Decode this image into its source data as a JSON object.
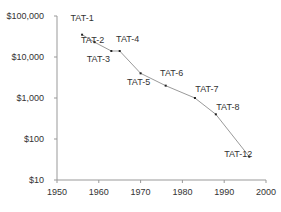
{
  "chart_data": {
    "type": "line",
    "title": "",
    "xlabel": "",
    "ylabel": "",
    "yscale": "log",
    "xlim": [
      1950,
      2000
    ],
    "ylim": [
      10,
      100000
    ],
    "grid": false,
    "x_ticks": [
      "1950",
      "1960",
      "1970",
      "1980",
      "1990",
      "2000"
    ],
    "y_ticks": [
      "$10",
      "$100",
      "$1,000",
      "$10,000",
      "$100,000"
    ],
    "series": [
      {
        "name": "TAT cable cost",
        "points": [
          {
            "label": "TAT-1",
            "x": 1956,
            "y": 35000
          },
          {
            "label": "TAT-2",
            "x": 1959,
            "y": 23000
          },
          {
            "label": "TAT-3",
            "x": 1963,
            "y": 14000
          },
          {
            "label": "TAT-4",
            "x": 1965,
            "y": 14000
          },
          {
            "label": "TAT-5",
            "x": 1970,
            "y": 4000
          },
          {
            "label": "TAT-6",
            "x": 1976,
            "y": 2000
          },
          {
            "label": "TAT-7",
            "x": 1983,
            "y": 1000
          },
          {
            "label": "TAT-8",
            "x": 1988,
            "y": 400
          },
          {
            "label": "TAT-12",
            "x": 1996,
            "y": 37
          }
        ]
      }
    ],
    "colors": {
      "line": "#9a9a9a",
      "marker": "#222222",
      "axis": "#999999",
      "text": "#333333"
    }
  }
}
